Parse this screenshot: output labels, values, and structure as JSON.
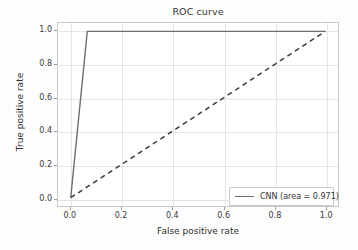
{
  "chart_data": {
    "type": "line",
    "title": "ROC curve",
    "xlabel": "False positive rate",
    "ylabel": "True positive rate",
    "xlim": [
      -0.05,
      1.05
    ],
    "ylim": [
      -0.05,
      1.05
    ],
    "grid": true,
    "legend_position": "lower right",
    "xticks": [
      "0.0",
      "0.2",
      "0.4",
      "0.6",
      "0.8",
      "1.0"
    ],
    "xtick_values": [
      0.0,
      0.2,
      0.4,
      0.6,
      0.8,
      1.0
    ],
    "yticks": [
      "0.0",
      "0.2",
      "0.4",
      "0.6",
      "0.8",
      "1.0"
    ],
    "ytick_values": [
      0.0,
      0.2,
      0.4,
      0.6,
      0.8,
      1.0
    ],
    "series": [
      {
        "name": "CNN (area = 0.971)",
        "legend_label": "CNN (area = 0.971)",
        "area": 0.971,
        "style": "solid",
        "color": "#6e6e6e",
        "x": [
          0.0,
          0.065,
          1.0
        ],
        "y": [
          0.0,
          1.0,
          1.0
        ]
      },
      {
        "name": "chance-diagonal",
        "legend_label": "",
        "style": "dashed",
        "color": "#3a3a3a",
        "x": [
          0.0,
          1.0
        ],
        "y": [
          0.0,
          1.0
        ]
      }
    ]
  },
  "legend": {
    "entries": [
      {
        "label": "CNN (area = 0.971)"
      }
    ]
  },
  "colors": {
    "curve": "#6e6e6e",
    "diagonal": "#3a3a3a",
    "grid": "#e4e4e4",
    "axis": "#c8c8c8",
    "background": "#ffffff"
  }
}
